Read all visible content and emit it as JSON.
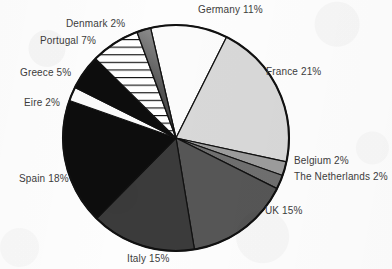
{
  "chart_data": {
    "type": "pie",
    "title": "",
    "subtitle": "",
    "xlabel": "",
    "ylabel": "",
    "legend_position": "none",
    "grid": false,
    "labels_show_percent": true,
    "categories": [
      "Germany",
      "France",
      "Belgium",
      "The Netherlands",
      "UK",
      "Italy",
      "Spain",
      "Eire",
      "Greece",
      "Portugal",
      "Denmark"
    ],
    "values": [
      11,
      21,
      2,
      2,
      15,
      15,
      18,
      2,
      5,
      7,
      2
    ],
    "units": "percent",
    "total": 100,
    "start_angle_deg": -13,
    "direction": "clockwise",
    "slices": [
      {
        "name": "Germany",
        "value": 11,
        "label": "Germany 11%",
        "fill": "#fbfbfb",
        "pattern": "solid"
      },
      {
        "name": "France",
        "value": 21,
        "label": "France 21%",
        "fill": "#d8d8d8",
        "pattern": "solid"
      },
      {
        "name": "Belgium",
        "value": 2,
        "label": "Belgium 2%",
        "fill": "#9c9c9c",
        "pattern": "solid"
      },
      {
        "name": "The Netherlands",
        "value": 2,
        "label": "The Netherlands 2%",
        "fill": "#6f6f6f",
        "pattern": "solid"
      },
      {
        "name": "UK",
        "value": 15,
        "label": "UK 15%",
        "fill": "#565656",
        "pattern": "solid"
      },
      {
        "name": "Italy",
        "value": 15,
        "label": "Italy 15%",
        "fill": "#3b3b3b",
        "pattern": "solid"
      },
      {
        "name": "Spain",
        "value": 18,
        "label": "Spain 18%",
        "fill": "#0d0d0d",
        "pattern": "solid"
      },
      {
        "name": "Eire",
        "value": 2,
        "label": "Eire 2%",
        "fill": "#fbfbfb",
        "pattern": "solid"
      },
      {
        "name": "Greece",
        "value": 5,
        "label": "Greece 5%",
        "fill": "#0d0d0d",
        "pattern": "solid"
      },
      {
        "name": "Portugal",
        "value": 7,
        "label": "Portugal 7%",
        "fill": "#ffffff",
        "pattern": "horizontal-lines"
      },
      {
        "name": "Denmark",
        "value": 2,
        "label": "Denmark 2%",
        "fill": "#4a4a4a",
        "pattern": "gradient"
      }
    ]
  },
  "labels": {
    "germany": "Germany 11%",
    "denmark": "Denmark 2%",
    "portugal": "Portugal 7%",
    "greece": "Greece 5%",
    "eire": "Eire 2%",
    "spain": "Spain 18%",
    "italy": "Italy 15%",
    "uk": "UK 15%",
    "netherlands": "The Netherlands 2%",
    "belgium": "Belgium 2%",
    "france": "France 21%"
  },
  "style": {
    "outline_color": "#111111",
    "text_color": "#3c3c3c",
    "background": "#fdfdfd"
  }
}
